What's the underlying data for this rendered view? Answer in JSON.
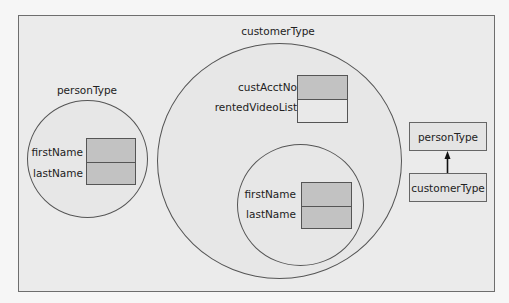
{
  "diagram": {
    "colors": {
      "filled_cell": "#c2c2c2",
      "empty_cell": "#e9e9e9",
      "stroke": "#555555"
    },
    "person_object": {
      "title": "personType",
      "members": [
        {
          "name": "firstName",
          "filled": true
        },
        {
          "name": "lastName",
          "filled": true
        }
      ]
    },
    "customer_object": {
      "title": "customerType",
      "members": [
        {
          "name": "custAcctNo",
          "filled": true
        },
        {
          "name": "rentedVideoList",
          "filled": false
        }
      ],
      "inherited": {
        "members": [
          {
            "name": "firstName",
            "filled": true
          },
          {
            "name": "lastName",
            "filled": true
          }
        ]
      }
    },
    "hierarchy": {
      "base": "personType",
      "derived": "customerType",
      "relation": "inherits"
    }
  }
}
